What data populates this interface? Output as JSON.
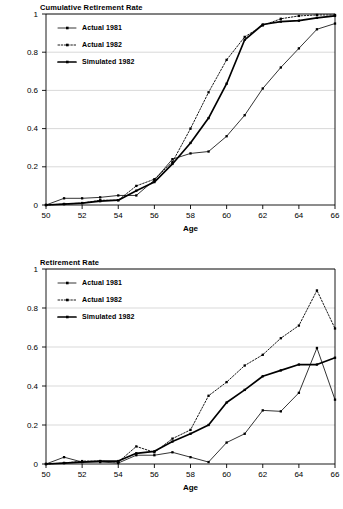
{
  "figure": {
    "x_axis_label": "Age",
    "y_ticks": [
      "0",
      "0.2",
      "0.4",
      "0.6",
      "0.8",
      "1"
    ],
    "x_ticks": [
      "50",
      "52",
      "54",
      "56",
      "58",
      "60",
      "62",
      "64",
      "66"
    ],
    "legend": {
      "actual_1981": "Actual 1981",
      "actual_1982": "Actual 1982",
      "simulated_1982": "Simulated 1982"
    }
  },
  "chart_data": [
    {
      "id": "cumulative",
      "type": "line",
      "title": "Cumulative Retirement Rate",
      "xlabel": "Age",
      "ylabel": "",
      "xlim": [
        50,
        66
      ],
      "ylim": [
        0,
        1
      ],
      "xticks": [
        50,
        52,
        54,
        56,
        58,
        60,
        62,
        64,
        66
      ],
      "yticks": [
        0,
        0.2,
        0.4,
        0.6,
        0.8,
        1
      ],
      "grid": "horizontal",
      "legend_position": "top-left-inside",
      "x": [
        50,
        51,
        52,
        53,
        54,
        55,
        56,
        57,
        58,
        59,
        60,
        61,
        62,
        63,
        64,
        65,
        66
      ],
      "series": [
        {
          "name": "Actual 1981",
          "style": "solid-thin",
          "marker": "square",
          "values": [
            0.0,
            0.035,
            0.035,
            0.04,
            0.05,
            0.05,
            0.13,
            0.24,
            0.27,
            0.28,
            0.36,
            0.47,
            0.61,
            0.72,
            0.82,
            0.92,
            0.95
          ]
        },
        {
          "name": "Actual 1982",
          "style": "dotted",
          "marker": "square",
          "values": [
            0.0,
            0.005,
            0.01,
            0.025,
            0.025,
            0.1,
            0.135,
            0.225,
            0.4,
            0.59,
            0.76,
            0.88,
            0.94,
            0.975,
            0.99,
            0.995,
            0.995
          ]
        },
        {
          "name": "Simulated 1982",
          "style": "solid-thick",
          "marker": "square",
          "values": [
            0.0,
            0.005,
            0.01,
            0.02,
            0.025,
            0.075,
            0.12,
            0.215,
            0.325,
            0.455,
            0.635,
            0.865,
            0.945,
            0.96,
            0.965,
            0.98,
            0.99
          ]
        }
      ]
    },
    {
      "id": "hazard",
      "type": "line",
      "title": "Retirement Rate",
      "xlabel": "Age",
      "ylabel": "",
      "xlim": [
        50,
        66
      ],
      "ylim": [
        0,
        1
      ],
      "xticks": [
        50,
        52,
        54,
        56,
        58,
        60,
        62,
        64,
        66
      ],
      "yticks": [
        0,
        0.2,
        0.4,
        0.6,
        0.8,
        1
      ],
      "grid": "horizontal",
      "legend_position": "top-left-inside",
      "x": [
        50,
        51,
        52,
        53,
        54,
        55,
        56,
        57,
        58,
        59,
        60,
        61,
        62,
        63,
        64,
        65,
        66
      ],
      "series": [
        {
          "name": "Actual 1981",
          "style": "solid-thin",
          "marker": "square",
          "values": [
            0.0,
            0.035,
            0.01,
            0.01,
            0.005,
            0.045,
            0.045,
            0.06,
            0.035,
            0.01,
            0.11,
            0.155,
            0.275,
            0.27,
            0.365,
            0.595,
            0.33
          ]
        },
        {
          "name": "Actual 1982",
          "style": "dotted",
          "marker": "square",
          "values": [
            0.0,
            0.005,
            0.015,
            0.015,
            0.01,
            0.09,
            0.06,
            0.13,
            0.175,
            0.35,
            0.42,
            0.505,
            0.56,
            0.645,
            0.71,
            0.89,
            0.695
          ]
        },
        {
          "name": "Simulated 1982",
          "style": "solid-thick",
          "marker": "square",
          "values": [
            0.0,
            0.005,
            0.01,
            0.015,
            0.015,
            0.055,
            0.065,
            0.115,
            0.155,
            0.2,
            0.315,
            0.38,
            0.45,
            0.48,
            0.51,
            0.51,
            0.545
          ]
        }
      ]
    }
  ]
}
